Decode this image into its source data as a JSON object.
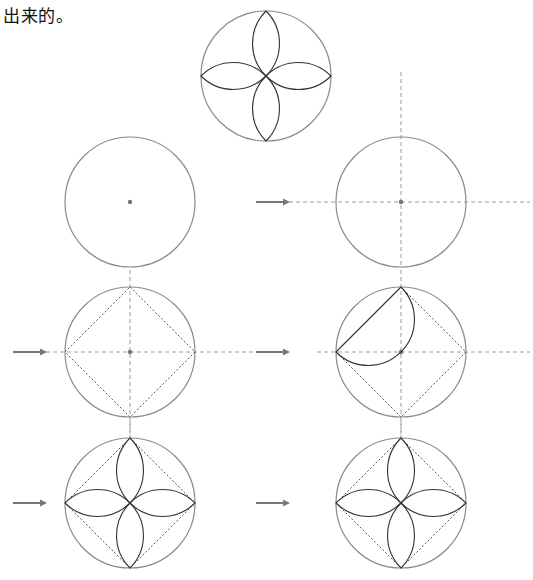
{
  "caption": {
    "text": "出来的。"
  },
  "diagram": {
    "colors": {
      "circle": "#8a8a8a",
      "guide_lines": "#9a9a9a",
      "petal": "#333333",
      "arrow": "#777777"
    },
    "figures": [
      {
        "id": "result",
        "label": "final flower",
        "cx": 266,
        "cy": 76,
        "r": 65,
        "guides": false,
        "square": false,
        "petals": 4,
        "half_arc": false,
        "arrow": false
      },
      {
        "id": "step-1",
        "label": "circle with center",
        "cx": 130,
        "cy": 202,
        "r": 65,
        "guides": false,
        "square": false,
        "petals": 0,
        "half_arc": false,
        "arrow": false
      },
      {
        "id": "step-2",
        "label": "draw center lines",
        "cx": 401,
        "cy": 202,
        "r": 65,
        "guides": true,
        "square": false,
        "petals": 0,
        "half_arc": false,
        "arrow": true
      },
      {
        "id": "step-3",
        "label": "inscribe square",
        "cx": 130,
        "cy": 352,
        "r": 65,
        "guides": true,
        "square": true,
        "petals": 0,
        "half_arc": false,
        "arrow": true
      },
      {
        "id": "step-4",
        "label": "draw first semicircle",
        "cx": 401,
        "cy": 352,
        "r": 65,
        "guides": true,
        "square": true,
        "petals": 0,
        "half_arc": true,
        "arrow": true
      },
      {
        "id": "step-5",
        "label": "draw petals",
        "cx": 130,
        "cy": 503,
        "r": 65,
        "guides": true,
        "square": true,
        "petals": 4,
        "half_arc": false,
        "arrow": true
      },
      {
        "id": "step-6",
        "label": "finished pattern",
        "cx": 401,
        "cy": 503,
        "r": 65,
        "guides": true,
        "square": true,
        "petals": 4,
        "half_arc": false,
        "arrow": true
      }
    ]
  }
}
